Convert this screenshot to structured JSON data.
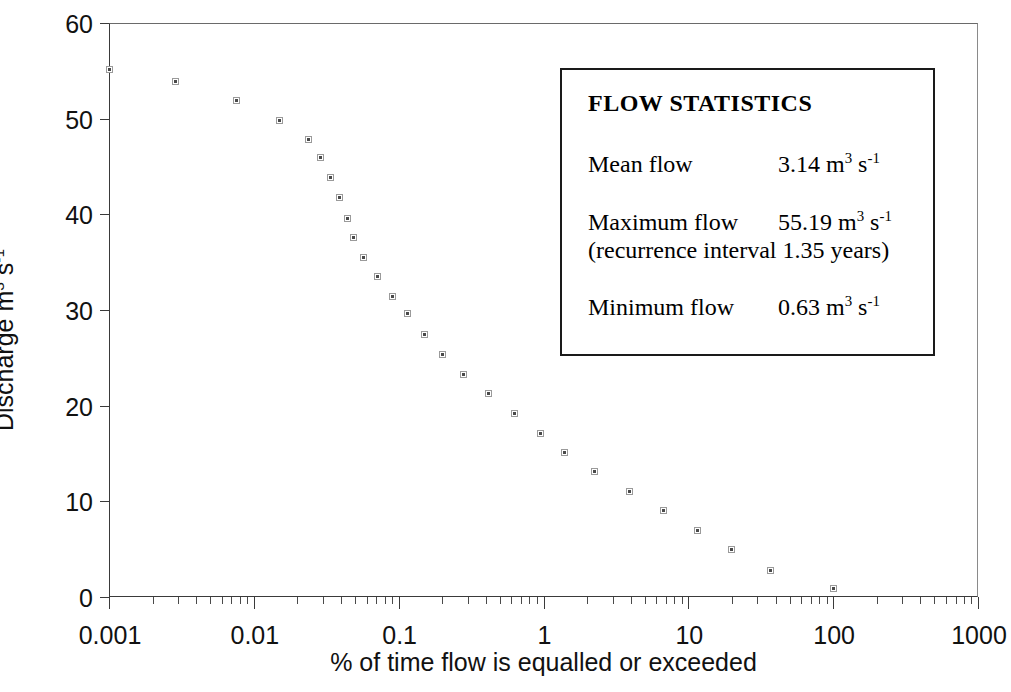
{
  "chart_data": {
    "type": "scatter",
    "title": "",
    "xlabel": "% of time flow is equalled or exceeded",
    "ylabel": "Discharge m3 s-1",
    "ylabel_parts": {
      "base": "Discharge m",
      "sup1": "3",
      "mid": " s",
      "sup2": "-1"
    },
    "xscale": "log",
    "yscale": "linear",
    "xlim": [
      0.001,
      1000
    ],
    "ylim": [
      0,
      60
    ],
    "grid": false,
    "legend_position": "inside-upper-right",
    "xticks": [
      {
        "value": 0.001,
        "label": "0.001"
      },
      {
        "value": 0.01,
        "label": "0.01"
      },
      {
        "value": 0.1,
        "label": "0.1"
      },
      {
        "value": 1,
        "label": "1"
      },
      {
        "value": 10,
        "label": "10"
      },
      {
        "value": 100,
        "label": "100"
      },
      {
        "value": 1000,
        "label": "1000"
      }
    ],
    "yticks": [
      {
        "value": 0,
        "label": "0"
      },
      {
        "value": 10,
        "label": "10"
      },
      {
        "value": 20,
        "label": "20"
      },
      {
        "value": 30,
        "label": "30"
      },
      {
        "value": 40,
        "label": "40"
      },
      {
        "value": 50,
        "label": "50"
      },
      {
        "value": 60,
        "label": "60"
      }
    ],
    "marker": {
      "shape": "square",
      "size": 7,
      "fill": "#4a4a4a",
      "edge": "#9a9a9a"
    },
    "points": [
      {
        "x": 0.001,
        "y": 55.19
      },
      {
        "x": 0.0029,
        "y": 53.9
      },
      {
        "x": 0.0076,
        "y": 51.9
      },
      {
        "x": 0.015,
        "y": 49.8
      },
      {
        "x": 0.024,
        "y": 47.8
      },
      {
        "x": 0.029,
        "y": 45.9
      },
      {
        "x": 0.034,
        "y": 43.8
      },
      {
        "x": 0.039,
        "y": 41.8
      },
      {
        "x": 0.044,
        "y": 39.6
      },
      {
        "x": 0.049,
        "y": 37.6
      },
      {
        "x": 0.057,
        "y": 35.5
      },
      {
        "x": 0.071,
        "y": 33.5
      },
      {
        "x": 0.09,
        "y": 31.4
      },
      {
        "x": 0.115,
        "y": 29.6
      },
      {
        "x": 0.15,
        "y": 27.4
      },
      {
        "x": 0.2,
        "y": 25.4
      },
      {
        "x": 0.28,
        "y": 23.3
      },
      {
        "x": 0.42,
        "y": 21.3
      },
      {
        "x": 0.63,
        "y": 19.2
      },
      {
        "x": 0.95,
        "y": 17.1
      },
      {
        "x": 1.4,
        "y": 15.1
      },
      {
        "x": 2.25,
        "y": 13.1
      },
      {
        "x": 3.9,
        "y": 11.0
      },
      {
        "x": 6.7,
        "y": 9.05
      },
      {
        "x": 11.5,
        "y": 6.95
      },
      {
        "x": 20.0,
        "y": 4.95
      },
      {
        "x": 37.0,
        "y": 2.8
      },
      {
        "x": 100.0,
        "y": 0.9
      }
    ]
  },
  "stats_box": {
    "title": "FLOW STATISTICS",
    "rows": [
      {
        "label": "Mean flow",
        "value_number": "3.14",
        "unit_m": " m",
        "unit_sup1": "3",
        "unit_s": " s",
        "unit_sup2": "-1",
        "sub": ""
      },
      {
        "label": "Maximum flow",
        "value_number": "55.19",
        "unit_m": " m",
        "unit_sup1": "3",
        "unit_s": " s",
        "unit_sup2": "-1",
        "sub": "(recurrence interval 1.35 years)"
      },
      {
        "label": "Minimum flow",
        "value_number": "0.63",
        "unit_m": " m",
        "unit_sup1": "3",
        "unit_s": " s",
        "unit_sup2": "-1",
        "sub": ""
      }
    ]
  }
}
